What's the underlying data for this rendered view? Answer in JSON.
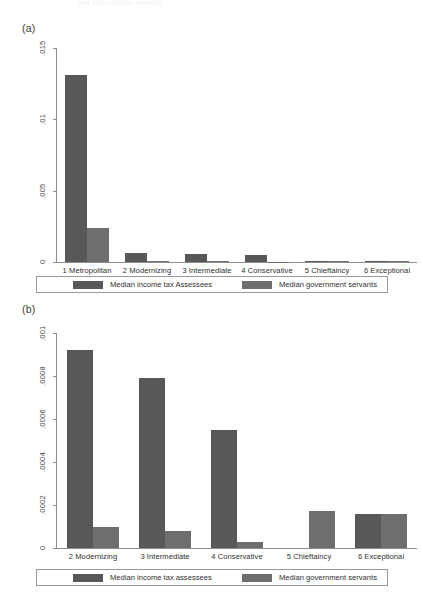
{
  "figure": {
    "fragment_header": "and sub-national variance",
    "panel_a_label": "(a)",
    "panel_b_label": "(b)"
  },
  "chart_data": [
    {
      "type": "bar",
      "id": "panel-a",
      "title": "(a)",
      "xlabel": "",
      "ylabel": "",
      "ylim": [
        0,
        0.015
      ],
      "yticks": [
        0,
        0.005,
        0.01,
        0.015
      ],
      "ytick_labels": [
        "0",
        ".005",
        ".01",
        ".015"
      ],
      "grid": false,
      "legend_position": "below",
      "categories": [
        "1 Metropolitan",
        "2 Modernizing",
        "3 Intermediate",
        "4 Conservative",
        "5 Chieftaincy",
        "6 Exceptional"
      ],
      "series": [
        {
          "name": "Median income tax Assessees",
          "color": "#585858",
          "values": [
            0.0131,
            0.00062,
            0.00055,
            0.00048,
            6e-05,
            4e-05
          ]
        },
        {
          "name": "Median government servants",
          "color": "#6e6e6e",
          "values": [
            0.00235,
            5e-05,
            4e-05,
            3e-05,
            8e-05,
            6e-05
          ]
        }
      ]
    },
    {
      "type": "bar",
      "id": "panel-b",
      "title": "(b)",
      "xlabel": "",
      "ylabel": "",
      "ylim": [
        0,
        0.001
      ],
      "yticks": [
        0,
        0.0002,
        0.0004,
        0.0006,
        0.0008,
        0.001
      ],
      "ytick_labels": [
        "0",
        ".0002",
        ".0004",
        ".0006",
        ".0008",
        ".001"
      ],
      "grid": false,
      "legend_position": "below",
      "categories": [
        "2 Modernizing",
        "3 Intermediate",
        "4 Conservative",
        "5 Chieftaincy",
        "6 Exceptional"
      ],
      "series": [
        {
          "name": "Median income tax assessees",
          "color": "#585858",
          "values": [
            0.00092,
            0.00079,
            0.00055,
            0.0,
            0.00016
          ]
        },
        {
          "name": "Median government servants",
          "color": "#6e6e6e",
          "values": [
            0.0001,
            8e-05,
            3e-05,
            0.00017,
            0.00016
          ]
        }
      ]
    }
  ],
  "panel_a": {
    "label": "(a)",
    "yticks": [
      "0",
      ".005",
      ".01",
      ".015"
    ],
    "xticks": [
      "1 Metropolitan",
      "2 Modernizing",
      "3 Intermediate",
      "4 Conservative",
      "5 Chieftaincy",
      "6 Exceptional"
    ],
    "legend": [
      "Median income tax Assessees",
      "Median government servants"
    ]
  },
  "panel_b": {
    "label": "(b)",
    "yticks": [
      "0",
      ".0002",
      ".0004",
      ".0006",
      ".0008",
      ".001"
    ],
    "xticks": [
      "2 Modernizing",
      "3 Intermediate",
      "4 Conservative",
      "5 Chieftaincy",
      "6 Exceptional"
    ],
    "legend": [
      "Median income tax assessees",
      "Median government servants"
    ]
  }
}
